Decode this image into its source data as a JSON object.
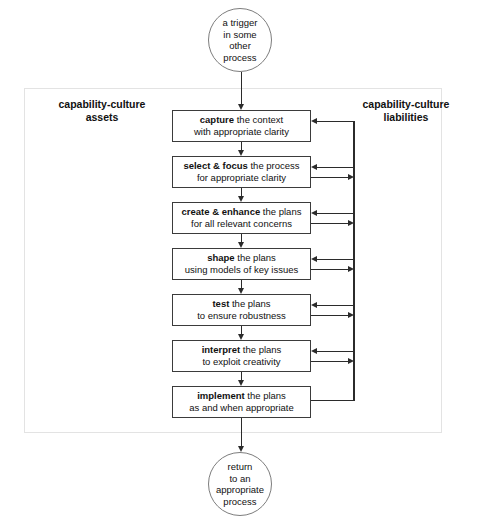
{
  "diagram": {
    "frame": {
      "present": true,
      "border_color": "#e3e3e3"
    },
    "labels": {
      "assets": "capability-culture\nassets",
      "liabilities": "capability-culture\nliabilities"
    },
    "terminators": {
      "start": "a trigger\nin some\nother\nprocess",
      "end": "return\nto an\nappropriate\nprocess"
    },
    "steps": [
      {
        "id": "capture",
        "emphasis": "capture",
        "rest": " the context",
        "line2": "with appropriate clarity",
        "feedback_in": true,
        "feedback_out": false
      },
      {
        "id": "select-focus",
        "emphasis": "select & focus",
        "rest": " the process",
        "line2": "for appropriate clarity",
        "feedback_in": true,
        "feedback_out": true
      },
      {
        "id": "create-enhance",
        "emphasis": "create & enhance",
        "rest": " the plans",
        "line2": "for all relevant  concerns",
        "feedback_in": true,
        "feedback_out": true
      },
      {
        "id": "shape",
        "emphasis": "shape",
        "rest": " the plans",
        "line2": "using models of  key issues",
        "feedback_in": true,
        "feedback_out": true
      },
      {
        "id": "test",
        "emphasis": "test",
        "rest": " the plans",
        "line2": "to ensure robustness",
        "feedback_in": true,
        "feedback_out": true
      },
      {
        "id": "interpret",
        "emphasis": "interpret",
        "rest": " the plans",
        "line2": "to exploit creativity",
        "feedback_in": true,
        "feedback_out": true
      },
      {
        "id": "implement",
        "emphasis": "implement",
        "rest": " the plans",
        "line2": "as and when appropriate",
        "feedback_in": false,
        "feedback_out": true
      }
    ],
    "colors": {
      "box_border": "#3b3b3b",
      "connector": "#2b2b2b",
      "circle_border": "#7d7d7d",
      "frame_border": "#e3e3e3",
      "text": "#111111"
    }
  }
}
